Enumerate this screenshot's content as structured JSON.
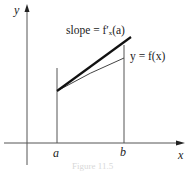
{
  "figure": {
    "axes": {
      "x_label": "x",
      "y_label": "y"
    },
    "ticks": {
      "a": "a",
      "b": "b"
    },
    "annotations": {
      "slope": "slope = f′ₓ(a)",
      "curve": "y = f(x)"
    },
    "caption": "Figure 11.5"
  }
}
